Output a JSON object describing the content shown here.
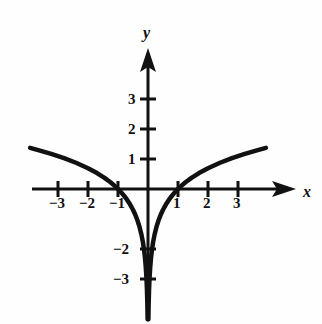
{
  "figure": {
    "background_color": "#fefefe",
    "ink_color": "#111111"
  },
  "axes": {
    "x_axis_label": "x",
    "y_axis_label": "y",
    "x_axis_label_pos": {
      "x": 303,
      "y": 184
    },
    "y_axis_label_pos": {
      "x": 143,
      "y": 25
    },
    "origin_px": {
      "x": 148,
      "y": 189
    },
    "unit_px": 30,
    "arrow_x": true,
    "arrow_y": true,
    "grid": false
  },
  "x_ticks": [
    {
      "value": -3,
      "label": "−3",
      "px": 58,
      "label_px": {
        "x": 49,
        "y": 196
      }
    },
    {
      "value": -2,
      "label": "−2",
      "px": 88,
      "label_px": {
        "x": 79,
        "y": 196
      }
    },
    {
      "value": -1,
      "label": "−1",
      "px": 118,
      "label_px": {
        "x": 109,
        "y": 196
      }
    },
    {
      "value": 1,
      "label": "1",
      "px": 178,
      "label_px": {
        "x": 173,
        "y": 196
      }
    },
    {
      "value": 2,
      "label": "2",
      "px": 208,
      "label_px": {
        "x": 203,
        "y": 196
      }
    },
    {
      "value": 3,
      "label": "3",
      "px": 238,
      "label_px": {
        "x": 233,
        "y": 196
      }
    }
  ],
  "y_ticks": [
    {
      "value": 3,
      "label": "3",
      "px": 99,
      "label_px": {
        "x": 128,
        "y": 92
      }
    },
    {
      "value": 2,
      "label": "2",
      "px": 129,
      "label_px": {
        "x": 128,
        "y": 122
      }
    },
    {
      "value": 1,
      "label": "1",
      "px": 159,
      "label_px": {
        "x": 128,
        "y": 152
      }
    },
    {
      "value": -2,
      "label": "−2",
      "px": 249,
      "label_px": {
        "x": 113,
        "y": 242
      }
    },
    {
      "value": -3,
      "label": "−3",
      "px": 279,
      "label_px": {
        "x": 113,
        "y": 272
      }
    }
  ],
  "chart_data": {
    "type": "line",
    "title": "",
    "xlabel": "x",
    "ylabel": "y",
    "xlim": [
      -4.9,
      5.6
    ],
    "ylim": [
      -4.4,
      4.9
    ],
    "function": "y = ln|x|",
    "zeros": [
      -1,
      1
    ],
    "vertical_asymptote": 0,
    "series": [
      {
        "name": "left-branch",
        "x": [
          -3.93,
          -3.6,
          -3.2,
          -2.8,
          -2.4,
          -2.0,
          -1.7,
          -1.45,
          -1.25,
          -1.1,
          -1.0,
          -0.9,
          -0.8,
          -0.7,
          -0.6,
          -0.5,
          -0.42,
          -0.35,
          -0.28,
          -0.22,
          -0.17,
          -0.13,
          -0.1,
          -0.075,
          -0.05,
          -0.035,
          -0.022,
          -0.013
        ],
        "y": [
          1.37,
          1.28,
          1.16,
          1.03,
          0.875,
          0.693,
          0.531,
          0.372,
          0.223,
          0.095,
          0.0,
          -0.105,
          -0.223,
          -0.357,
          -0.511,
          -0.693,
          -0.868,
          -1.05,
          -1.273,
          -1.514,
          -1.772,
          -2.04,
          -2.303,
          -2.59,
          -3.0,
          -3.35,
          -3.82,
          -4.34
        ]
      },
      {
        "name": "right-branch",
        "x": [
          0.013,
          0.022,
          0.035,
          0.05,
          0.075,
          0.1,
          0.13,
          0.17,
          0.22,
          0.28,
          0.35,
          0.42,
          0.5,
          0.6,
          0.7,
          0.8,
          0.9,
          1.0,
          1.1,
          1.25,
          1.45,
          1.7,
          2.0,
          2.4,
          2.8,
          3.2,
          3.6,
          3.93
        ],
        "y": [
          -4.34,
          -3.82,
          -3.35,
          -3.0,
          -2.59,
          -2.303,
          -2.04,
          -1.772,
          -1.514,
          -1.273,
          -1.05,
          -0.868,
          -0.693,
          -0.511,
          -0.357,
          -0.223,
          -0.105,
          0.0,
          0.095,
          0.223,
          0.372,
          0.531,
          0.693,
          0.875,
          1.03,
          1.16,
          1.28,
          1.37
        ]
      }
    ]
  }
}
